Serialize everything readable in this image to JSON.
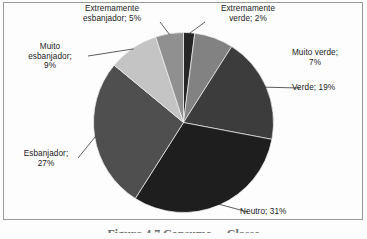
{
  "figure": {
    "caption": "Figura 4.7 Consumo ... Classe",
    "background_color": "#fdfdfd",
    "border_color": "#9a9a9a"
  },
  "chart_data": {
    "type": "pie",
    "title": "",
    "xlabel": "",
    "ylabel": "",
    "legend_position": "none",
    "grid": false,
    "label_format": "{name}; {value}%",
    "total": 100,
    "units": "%",
    "start_angle_deg": 0,
    "direction": "clockwise",
    "categories": [
      "Extremamente verde",
      "Muito verde",
      "Verde",
      "Neutro",
      "Esbanjador",
      "Muito esbanjador",
      "Extremamente esbanjador"
    ],
    "values": [
      2,
      7,
      19,
      31,
      27,
      9,
      5
    ],
    "colors": [
      "#262626",
      "#828282",
      "#3c3c3c",
      "#1e1e1e",
      "#4f4f4f",
      "#c4c4c4",
      "#909090"
    ],
    "slices": [
      {
        "name": "Extremamente verde",
        "value": 2,
        "label": "Extremamente\nverde; 2%",
        "color": "#262626",
        "leader_line": true
      },
      {
        "name": "Muito verde",
        "value": 7,
        "label": "Muito verde;\n7%",
        "color": "#828282",
        "leader_line": false
      },
      {
        "name": "Verde",
        "value": 19,
        "label": "Verde; 19%",
        "color": "#3c3c3c",
        "leader_line": true
      },
      {
        "name": "Neutro",
        "value": 31,
        "label": "Neutro; 31%",
        "color": "#1e1e1e",
        "leader_line": true
      },
      {
        "name": "Esbanjador",
        "value": 27,
        "label": "Esbanjador;\n27%",
        "color": "#4f4f4f",
        "leader_line": true
      },
      {
        "name": "Muito esbanjador",
        "value": 9,
        "label": "Muito\nesbanjador;\n9%",
        "color": "#c4c4c4",
        "leader_line": true
      },
      {
        "name": "Extremamente esbanjador",
        "value": 5,
        "label": "Extremamente\nesbanjador; 5%",
        "color": "#909090",
        "leader_line": true
      }
    ]
  }
}
